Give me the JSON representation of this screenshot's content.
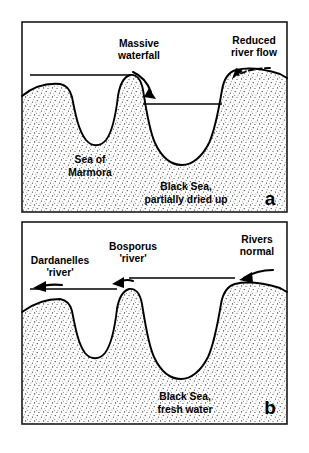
{
  "figure": {
    "background_color": "#ffffff",
    "line_color": "#000000",
    "stipple_color": "#1e1e1e"
  },
  "panels": [
    {
      "letter": "a",
      "caption_state": "partially dried up",
      "labels": {
        "center_top_line1": "Massive",
        "center_top_line2": "waterfall",
        "right_top_line1": "Reduced",
        "right_top_line2": "river flow",
        "left_basin_line1": "Sea of",
        "left_basin_line2": "Marmora",
        "right_basin_line1": "Black Sea,",
        "right_basin_line2": "partially dried up"
      },
      "arrows": [
        {
          "name": "waterfall-cascade",
          "style": "solid",
          "direction": "down-right"
        },
        {
          "name": "reduced-river-inflow",
          "style": "dashed",
          "direction": "down-left"
        }
      ],
      "water_levels": [
        {
          "name": "marmora-sea-level",
          "relative_height": "high"
        },
        {
          "name": "black-sea-level",
          "relative_height": "low"
        }
      ]
    },
    {
      "letter": "b",
      "caption_state": "fresh water",
      "labels": {
        "left_top_line1": "Dardanelles",
        "left_top_line2": "'river'",
        "center_top_line1": "Bosporus",
        "center_top_line2": "'river'",
        "right_top_line1": "Rivers",
        "right_top_line2": "normal",
        "basin_line1": "Black Sea,",
        "basin_line2": "fresh water"
      },
      "arrows": [
        {
          "name": "dardanelles-outflow",
          "style": "solid",
          "direction": "left"
        },
        {
          "name": "bosporus-outflow",
          "style": "solid",
          "direction": "up-left"
        },
        {
          "name": "rivers-normal-inflow",
          "style": "solid",
          "direction": "left"
        }
      ],
      "water_levels": [
        {
          "name": "continuous-water-level",
          "relative_height": "high"
        }
      ]
    }
  ]
}
